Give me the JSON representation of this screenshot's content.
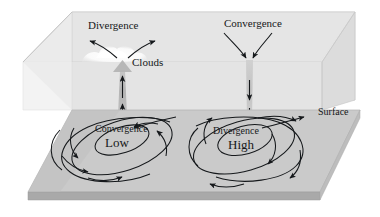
{
  "figure": {
    "type": "diagram",
    "width": 380,
    "height": 217
  },
  "labels": {
    "divergence_top": "Divergence",
    "convergence_top": "Convergence",
    "clouds": "Clouds",
    "surface": "Surface",
    "convergence_low": "Convergence",
    "low": "Low",
    "divergence_high": "Divergence",
    "high": "High"
  },
  "colors": {
    "background": "#ffffff",
    "box_top_face": "#e0e0e0",
    "box_back_face": "#e7e7e7",
    "box_left_face": "#eeeeee",
    "ground_top": "#c9c9c9",
    "ground_front_edge": "#a9a9a9",
    "ground_side_edge": "#bcbcbc",
    "outline": "#b4b4b4",
    "arrow": "#15181b",
    "updraft_column": "#b0b0b0",
    "downdraft_column": "#c0c0c0",
    "cloud": "#f6f6f6",
    "text": "#16181a"
  },
  "elements": {
    "upper_box": "transparent grey slab representing the atmosphere above the surface",
    "ground_slab": "grey parallelogram slab representing the earth surface",
    "updraft": "wide tapered vertical arrow rising from the Low toward the cloud",
    "downdraft": "narrow vertical arrow descending from aloft into the High",
    "cloud_puff": "white billowy cloud at the top of the updraft",
    "low_spiral": "counterclockwise inward spiral around the Low",
    "high_spiral": "clockwise outward spiral around the High",
    "aloft_divergence_arrows": "pair of arrows spreading outward above the Low",
    "aloft_convergence_arrows": "pair of arrows converging inward above the High"
  }
}
